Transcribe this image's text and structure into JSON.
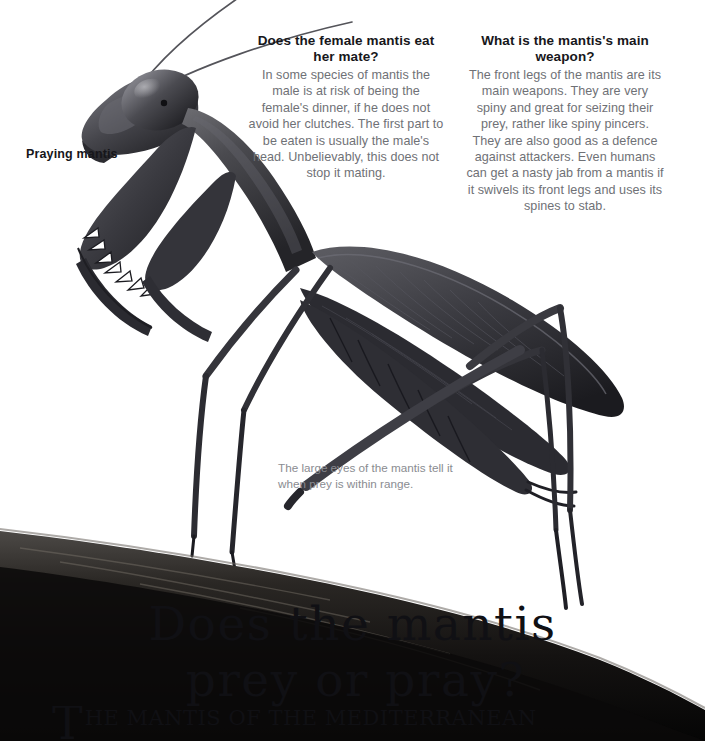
{
  "page": {
    "background_color": "#ffffff",
    "heading_color": "#17171b",
    "body_text_color": "#6f7176",
    "caption_color": "#8a8c91",
    "illustration_color": "#3a3a3e"
  },
  "questions": [
    {
      "heading": "Does the female mantis eat her mate?",
      "body": "In some species of mantis the male is at risk of being the female's dinner, if he does not avoid her clutches. The first part to be eaten is usually the male's head. Unbelievably, this does not stop it mating."
    },
    {
      "heading": "What is the mantis's main weapon?",
      "body": "The front legs of the mantis are its main weapons. They are very spiny and great for seizing their prey, rather like spiny pincers. They are also good as a defence against attackers. Even humans can get a nasty jab from a mantis if it swivels its front legs and uses its spines to stab."
    }
  ],
  "labels": {
    "specimen": "Praying mantis",
    "eye_caption": "The large eyes of the mantis tell it when prey is within range."
  },
  "headline": {
    "line1": "Does the mantis",
    "line2": "prey or pray?"
  },
  "body_copy": {
    "dropcap": "T",
    "text": "HE MANTIS OF THE MEDITERRANEAN"
  },
  "illustration": {
    "subject": "praying-mantis",
    "perch": "tree-branch",
    "parts": [
      "antennae",
      "head",
      "compound-eye",
      "prothorax",
      "raptorial-forelegs",
      "wings",
      "abdomen",
      "middle-legs",
      "hind-legs"
    ]
  }
}
